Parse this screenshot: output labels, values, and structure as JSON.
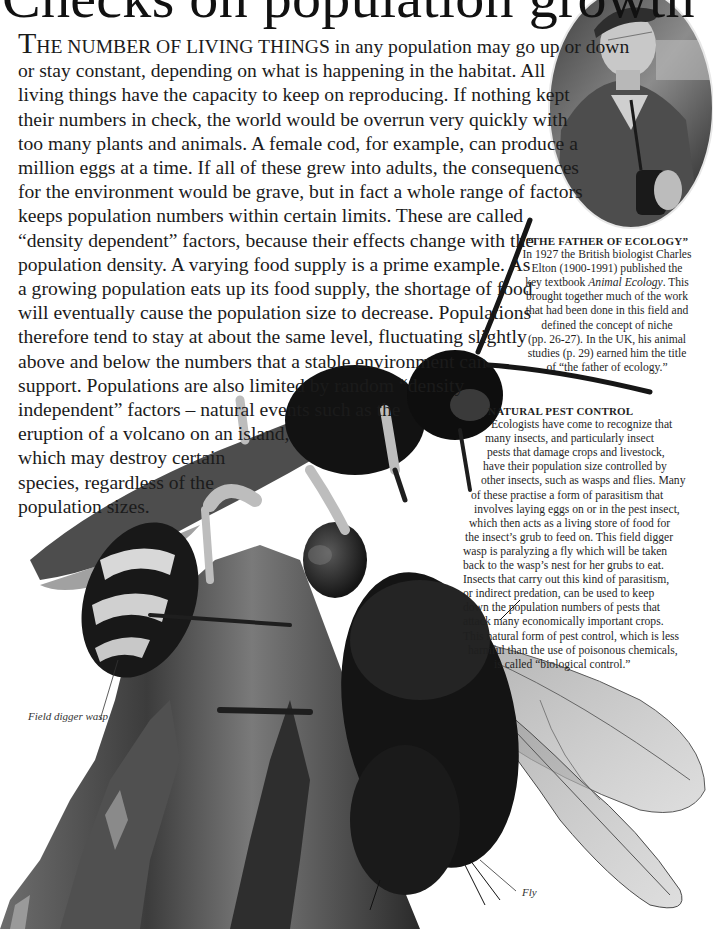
{
  "title": "Checks on population growth",
  "body": {
    "dropcap": "T",
    "lead_smallcaps": "HE NUMBER OF LIVING THINGS",
    "lines": [
      " in any population may go up or down",
      "or stay constant, depending on what is happening in the habitat. All",
      "living things have the capacity to keep on reproducing. If nothing kept",
      "their numbers in check, the world would be overrun very quickly with",
      "too many plants and animals. A female cod, for example, can produce a",
      "million eggs at a time. If all of these grew into adults, the consequences",
      "for the environment would be grave, but in fact a whole range of factors",
      "keeps population numbers within certain limits. These are called",
      "“density dependent” factors, because their effects change with the",
      "population density. A varying food supply is a prime example. As",
      "a growing population eats up its food supply, the shortage of food",
      "will eventually cause the population size to decrease. Populations",
      "therefore tend to stay at about the same level, fluctuating slightly",
      "above and below the numbers that a stable environment can",
      "support. Populations are also limited by random “density",
      "independent” factors – natural events such as the",
      "eruption of a volcano on an island,",
      "which may destroy certain",
      "species, regardless of the",
      "population sizes."
    ]
  },
  "portrait_caption": {
    "heading": "“THE FATHER OF ECOLOGY”",
    "lines": [
      "In 1927 the British biologist Charles",
      "Elton (1900-1991) published the",
      "key textbook ",
      "brought together much of the work",
      "that had been done in this field and",
      "defined the concept of niche",
      "(pp. 26-27). In the UK, his animal",
      "studies (p. 29) earned him the title",
      "of “the father of ecology.”"
    ],
    "book_title": "Animal Ecology",
    "book_suffix": ". This"
  },
  "pest_caption": {
    "heading": "NATURAL PEST CONTROL",
    "lines": [
      "Ecologists have come to recognize that",
      "many insects, and particularly insect",
      "pests that damage crops and livestock,",
      "have their population size controlled by",
      "other insects, such as wasps and flies. Many",
      "of these practise a form of parasitism that",
      "involves laying eggs on or in the pest insect,",
      "which then acts as a living store of food for",
      "the insect’s grub to feed on. This field digger",
      "wasp is paralyzing a fly which will be taken",
      "back to the wasp’s nest for her grubs to eat.",
      "Insects that carry out this kind of parasitism,",
      "or indirect predation, can be used to keep",
      "down the population numbers of pests that",
      "attack many economically important crops.",
      "This natural form of pest control, which is less",
      "harmful than the use of poisonous chemicals,",
      "is called “biological control.”"
    ],
    "indents": [
      18,
      8,
      12,
      10,
      16,
      2,
      10,
      2,
      0,
      4,
      0,
      0,
      0,
      0,
      0,
      0,
      8,
      32
    ]
  },
  "labels": {
    "wasp": "Field digger wasp",
    "fly": "Fly"
  },
  "images": {
    "portrait": "oval-portrait-charles-elton",
    "main": "field-digger-wasp-paralyzing-fly-on-wood"
  },
  "colors": {
    "text": "#1b1b1b",
    "background": "#ffffff"
  }
}
